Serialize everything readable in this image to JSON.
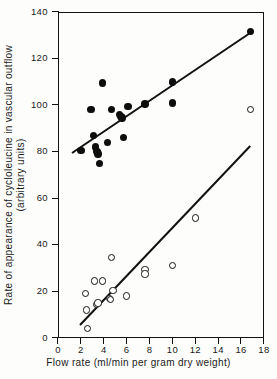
{
  "figure": {
    "background": "#fdfdfc",
    "ink": "#121212"
  },
  "axes": {
    "x_title": "Flow rate (ml/min per gram dry weight)",
    "y_title_line1": "Rate of appearance of cycloleucine in vascular outflow",
    "y_title_line2": "(arbitrary units)",
    "x_ticks": [
      "0",
      "2",
      "4",
      "6",
      "8",
      "10",
      "12",
      "14",
      "16",
      "18"
    ],
    "y_ticks": [
      "0",
      "20",
      "40",
      "60",
      "80",
      "100",
      "120",
      "140"
    ]
  },
  "chart_data": {
    "type": "scatter",
    "title": "",
    "xlabel": "Flow rate (ml/min per gram dry weight)",
    "ylabel": "Rate of appearance of cycloleucine in vascular outflow (arbitrary units)",
    "xlim": [
      0,
      18
    ],
    "ylim": [
      0,
      140
    ],
    "xticks": [
      0,
      2,
      4,
      6,
      8,
      10,
      12,
      14,
      16,
      18
    ],
    "yticks": [
      0,
      20,
      40,
      60,
      80,
      100,
      120,
      140
    ],
    "grid": false,
    "legend": "none",
    "series": [
      {
        "name": "filled-circles",
        "marker": "filled circle",
        "color": "#0d0d0d",
        "points": [
          [
            2.0,
            80.5
          ],
          [
            2.9,
            98.0
          ],
          [
            3.1,
            87.0
          ],
          [
            3.3,
            82.0
          ],
          [
            3.4,
            80.0
          ],
          [
            3.5,
            79.0
          ],
          [
            3.6,
            75.0
          ],
          [
            3.9,
            109.5
          ],
          [
            4.3,
            84.0
          ],
          [
            4.7,
            98.0
          ],
          [
            5.4,
            96.0
          ],
          [
            5.5,
            95.0
          ],
          [
            5.6,
            94.5
          ],
          [
            5.7,
            86.0
          ],
          [
            6.1,
            99.5
          ],
          [
            7.6,
            100.5
          ],
          [
            10.0,
            110.0
          ],
          [
            10.0,
            101.0
          ],
          [
            16.8,
            131.5
          ]
        ],
        "fit_line": {
          "x0": 1.2,
          "y0": 80.0,
          "x1": 16.9,
          "y1": 132.0
        }
      },
      {
        "name": "open-circles",
        "marker": "open circle",
        "color": "#ffffff",
        "edge": "#121212",
        "points": [
          [
            2.4,
            19.0
          ],
          [
            2.5,
            12.0
          ],
          [
            2.6,
            4.0
          ],
          [
            3.2,
            24.5
          ],
          [
            3.4,
            14.5
          ],
          [
            3.5,
            15.0
          ],
          [
            3.9,
            24.5
          ],
          [
            4.5,
            17.0
          ],
          [
            4.6,
            16.5
          ],
          [
            4.7,
            34.5
          ],
          [
            4.8,
            20.5
          ],
          [
            6.0,
            18.0
          ],
          [
            7.6,
            29.5
          ],
          [
            7.6,
            27.5
          ],
          [
            10.0,
            31.0
          ],
          [
            12.0,
            51.5
          ],
          [
            16.8,
            98.0
          ]
        ],
        "fit_line": {
          "x0": 1.9,
          "y0": 6.0,
          "x1": 16.8,
          "y1": 83.0
        }
      }
    ]
  }
}
